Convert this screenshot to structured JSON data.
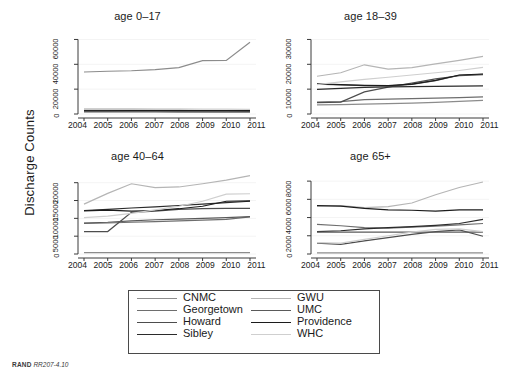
{
  "figure": {
    "ylabel": "Discharge Counts",
    "credit_prefix": "RAND",
    "credit_id": "RR207-4.10"
  },
  "legend": {
    "columns": [
      [
        {
          "label": "CNMC",
          "color": "#8c8c8c"
        },
        {
          "label": "Georgetown",
          "color": "#6e6e6e"
        },
        {
          "label": "Howard",
          "color": "#4d4d4d"
        },
        {
          "label": "Sibley",
          "color": "#2b2b2b"
        }
      ],
      [
        {
          "label": "GWU",
          "color": "#b5b5b5"
        },
        {
          "label": "UMC",
          "color": "#5a5a5a"
        },
        {
          "label": "Providence",
          "color": "#1c1c1c"
        },
        {
          "label": "WHC",
          "color": "#cfcfcf"
        }
      ]
    ]
  },
  "chart_data": [
    {
      "type": "line",
      "title": "age 0–17",
      "xlabel": "",
      "ylabel": "Discharge Counts",
      "x": [
        2004,
        2005,
        2006,
        2007,
        2008,
        2009,
        2010,
        2011
      ],
      "xticklabels": [
        "2004",
        "2005",
        "2006",
        "2007",
        "2008",
        "2009",
        "2010",
        "2011"
      ],
      "yticks": [
        0,
        20000,
        40000,
        60000
      ],
      "yticklabels": [
        "0",
        "20000",
        "40000",
        "60000"
      ],
      "ylim": [
        0,
        66000
      ],
      "grid": false,
      "series": [
        {
          "name": "CNMC",
          "color": "#8c8c8c",
          "values": [
            33800,
            34400,
            34800,
            35700,
            37300,
            42900,
            43100,
            57800
          ]
        },
        {
          "name": "Georgetown",
          "color": "#6e6e6e",
          "values": [
            2200,
            2150,
            2100,
            2050,
            2000,
            1950,
            1950,
            1900
          ]
        },
        {
          "name": "Howard",
          "color": "#4d4d4d",
          "values": [
            2400,
            2400,
            2350,
            2300,
            2250,
            2200,
            2200,
            2150
          ]
        },
        {
          "name": "Sibley",
          "color": "#2b2b2b",
          "values": [
            2600,
            2600,
            2600,
            2600,
            2550,
            2550,
            2550,
            2500
          ]
        },
        {
          "name": "GWU",
          "color": "#b5b5b5",
          "values": [
            1500,
            1500,
            1450,
            1450,
            1400,
            1400,
            1350,
            1350
          ]
        },
        {
          "name": "UMC",
          "color": "#5a5a5a",
          "values": [
            1900,
            1850,
            1800,
            1800,
            1750,
            1700,
            1700,
            1650
          ]
        },
        {
          "name": "Providence",
          "color": "#1c1c1c",
          "values": [
            3000,
            3000,
            2950,
            2900,
            2850,
            2800,
            2800,
            2750
          ]
        },
        {
          "name": "WHC",
          "color": "#cfcfcf",
          "values": [
            4400,
            4350,
            4300,
            4200,
            4100,
            4000,
            3900,
            3800
          ]
        }
      ]
    },
    {
      "type": "line",
      "title": "age 18–39",
      "xlabel": "",
      "ylabel": "Discharge Counts",
      "x": [
        2004,
        2005,
        2006,
        2007,
        2008,
        2009,
        2010,
        2011
      ],
      "xticklabels": [
        "2004",
        "2005",
        "2006",
        "2007",
        "2008",
        "2009",
        "2010",
        "2011"
      ],
      "yticks": [
        0,
        10000,
        20000,
        30000
      ],
      "yticklabels": [
        "0",
        "10000",
        "20000",
        "30000"
      ],
      "ylim": [
        0,
        33000
      ],
      "grid": false,
      "series": [
        {
          "name": "CNMC",
          "color": "#8c8c8c",
          "values": [
            3700,
            3800,
            4000,
            4200,
            4400,
            4700,
            5100,
            5500
          ]
        },
        {
          "name": "Georgetown",
          "color": "#6e6e6e",
          "values": [
            4800,
            5000,
            5800,
            6000,
            6200,
            6400,
            6600,
            6900
          ]
        },
        {
          "name": "Howard",
          "color": "#4d4d4d",
          "values": [
            4600,
            4800,
            8900,
            10800,
            12400,
            14100,
            15400,
            15800
          ]
        },
        {
          "name": "Sibley",
          "color": "#2b2b2b",
          "values": [
            9900,
            10300,
            10700,
            10900,
            11000,
            11100,
            11200,
            11300
          ]
        },
        {
          "name": "GWU",
          "color": "#b5b5b5",
          "values": [
            15200,
            16600,
            19800,
            18100,
            18700,
            20200,
            21600,
            23200
          ]
        },
        {
          "name": "UMC",
          "color": "#5a5a5a",
          "values": [
            12000,
            11700,
            11400,
            11300,
            11900,
            13400,
            15600,
            16000
          ]
        },
        {
          "name": "Providence",
          "color": "#1c1c1c",
          "values": [
            12100,
            11800,
            11500,
            11400,
            12000,
            13500,
            15700,
            16100
          ]
        },
        {
          "name": "WHC",
          "color": "#cfcfcf",
          "values": [
            11800,
            12900,
            13900,
            14800,
            15700,
            16600,
            17500,
            18800
          ]
        }
      ]
    },
    {
      "type": "line",
      "title": "age 40–64",
      "xlabel": "",
      "ylabel": "Discharge Counts",
      "x": [
        2004,
        2005,
        2006,
        2007,
        2008,
        2009,
        2010,
        2011
      ],
      "xticklabels": [
        "2004",
        "2005",
        "2006",
        "2007",
        "2008",
        "2009",
        "2010",
        "2011"
      ],
      "yticks": [
        0,
        5000,
        10000,
        15000,
        20000
      ],
      "yticklabels": [
        "0",
        "5000",
        "10000",
        "15000",
        "20000"
      ],
      "ylim": [
        0,
        23000
      ],
      "grid": false,
      "series": [
        {
          "name": "CNMC",
          "color": "#8c8c8c",
          "values": [
            400,
            400,
            400,
            400,
            400,
            400,
            400,
            400
          ]
        },
        {
          "name": "Georgetown",
          "color": "#6e6e6e",
          "values": [
            8600,
            8700,
            8900,
            9100,
            9300,
            9500,
            9700,
            10400
          ]
        },
        {
          "name": "Howard",
          "color": "#4d4d4d",
          "values": [
            6300,
            6300,
            11700,
            12000,
            12500,
            12700,
            12800,
            12800
          ]
        },
        {
          "name": "Sibley",
          "color": "#2b2b2b",
          "values": [
            12200,
            12500,
            12900,
            13200,
            13600,
            14000,
            14400,
            14800
          ]
        },
        {
          "name": "GWU",
          "color": "#b5b5b5",
          "values": [
            14000,
            17000,
            19700,
            18600,
            18800,
            19700,
            20700,
            22000
          ]
        },
        {
          "name": "UMC",
          "color": "#5a5a5a",
          "values": [
            8700,
            8900,
            9300,
            9600,
            9800,
            10000,
            10200,
            10500
          ]
        },
        {
          "name": "Providence",
          "color": "#1c1c1c",
          "values": [
            12100,
            12300,
            12000,
            12200,
            12700,
            13400,
            14800,
            14900
          ]
        },
        {
          "name": "WHC",
          "color": "#cfcfcf",
          "values": [
            10200,
            10600,
            11400,
            12400,
            13400,
            14800,
            16800,
            16900
          ]
        }
      ]
    },
    {
      "type": "line",
      "title": "age 65+",
      "xlabel": "",
      "ylabel": "Discharge Counts",
      "x": [
        2004,
        2005,
        2006,
        2007,
        2008,
        2009,
        2010,
        2011
      ],
      "xticklabels": [
        "2004",
        "2005",
        "2006",
        "2007",
        "2008",
        "2009",
        "2010",
        "2011"
      ],
      "yticks": [
        0,
        2000,
        4000,
        6000,
        8000
      ],
      "yticklabels": [
        "0",
        "2000",
        "4000",
        "6000",
        "8000"
      ],
      "ylim": [
        0,
        9000
      ],
      "grid": false,
      "series": [
        {
          "name": "CNMC",
          "color": "#8c8c8c",
          "values": [
            120,
            120,
            120,
            120,
            120,
            120,
            120,
            120
          ]
        },
        {
          "name": "Georgetown",
          "color": "#6e6e6e",
          "values": [
            3250,
            3100,
            2900,
            2850,
            2950,
            3050,
            3200,
            3350
          ]
        },
        {
          "name": "Howard",
          "color": "#4d4d4d",
          "values": [
            1200,
            1050,
            1450,
            1800,
            2150,
            2450,
            2650,
            1950
          ]
        },
        {
          "name": "Sibley",
          "color": "#2b2b2b",
          "values": [
            2450,
            2550,
            2750,
            2900,
            3000,
            3150,
            3350,
            3800
          ]
        },
        {
          "name": "GWU",
          "color": "#b5b5b5",
          "values": [
            5250,
            5300,
            5100,
            5200,
            5600,
            6500,
            7300,
            7900
          ]
        },
        {
          "name": "UMC",
          "color": "#5a5a5a",
          "values": [
            2400,
            2400,
            2400,
            2400,
            2400,
            2400,
            2400,
            2400
          ]
        },
        {
          "name": "Providence",
          "color": "#1c1c1c",
          "values": [
            5300,
            5250,
            5000,
            4850,
            4800,
            4700,
            4850,
            4850
          ]
        },
        {
          "name": "WHC",
          "color": "#cfcfcf",
          "values": [
            1250,
            1200,
            1600,
            2000,
            2400,
            2700,
            2750,
            2450
          ]
        }
      ]
    }
  ]
}
